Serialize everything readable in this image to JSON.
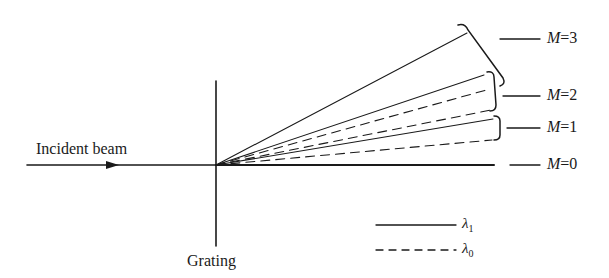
{
  "labels": {
    "incident_beam": "Incident beam",
    "grating": "Grating"
  },
  "orders": [
    {
      "name": "M",
      "value": "=3",
      "y": 39
    },
    {
      "name": "M",
      "value": "=2",
      "y": 96
    },
    {
      "name": "M",
      "value": "=1",
      "y": 128
    },
    {
      "name": "M",
      "value": "=0",
      "y": 165
    }
  ],
  "legend": [
    {
      "symbol": "λ",
      "sub": "1",
      "style": "solid"
    },
    {
      "symbol": "λ",
      "sub": "0",
      "style": "dashed"
    }
  ],
  "geometry": {
    "origin": [
      216,
      165
    ],
    "rays": [
      {
        "order": 3,
        "wavelength": "λ1",
        "style": "solid",
        "end": [
          467,
          33
        ]
      },
      {
        "order": 2,
        "wavelength": "λ1",
        "style": "solid",
        "end": [
          484,
          75
        ]
      },
      {
        "order": 2,
        "wavelength": "λ0",
        "style": "dashed",
        "end": [
          490,
          89
        ]
      },
      {
        "order": 1,
        "wavelength": "λ0",
        "style": "dashed",
        "end": [
          491,
          110
        ]
      },
      {
        "order": 1,
        "wavelength": "λ1",
        "style": "solid",
        "end": [
          493,
          119
        ]
      },
      {
        "order": 0,
        "wavelength": "λ0",
        "style": "dashed",
        "end": [
          492,
          140
        ]
      },
      {
        "order": 0,
        "wavelength": "both",
        "style": "solid",
        "end": [
          494,
          165
        ]
      }
    ]
  },
  "colors": {
    "ink": "#1a1a1a",
    "background": "#ffffff"
  }
}
